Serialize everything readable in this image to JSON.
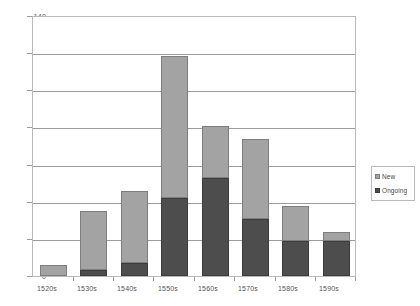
{
  "chart_data": {
    "type": "bar",
    "stacked": true,
    "title": "",
    "subtitle": "",
    "xlabel": "",
    "ylabel": "",
    "categories": [
      "1520s",
      "1530s",
      "1540s",
      "1550s",
      "1560s",
      "1570s",
      "1580s",
      "1590s"
    ],
    "series": [
      {
        "name": "Ongoing",
        "color": "#4d4d4d",
        "values": [
          0,
          3,
          7,
          42,
          53,
          31,
          19,
          19
        ]
      },
      {
        "name": "New",
        "color": "#a3a3a3",
        "values": [
          6,
          32,
          39,
          77,
          28,
          43,
          19,
          5
        ]
      }
    ],
    "totals": [
      6,
      35,
      46,
      119,
      81,
      74,
      38,
      24
    ],
    "ylim": [
      0,
      140
    ],
    "yticks": [
      0,
      20,
      40,
      60,
      80,
      100,
      120,
      140
    ],
    "ytick_labels": [
      "0",
      "20",
      "40",
      "60",
      "80",
      "100",
      "120",
      "140"
    ],
    "grid": true,
    "legend_position": "right",
    "legend": [
      {
        "label": "New",
        "swatch": "new"
      },
      {
        "label": "Ongoing",
        "swatch": "ongoing"
      }
    ]
  },
  "colors": {
    "ongoing": "#4d4d4d",
    "new": "#a3a3a3",
    "gridline": "#9c9c9c",
    "frame": "#b9b9b9",
    "text": "#535353"
  }
}
